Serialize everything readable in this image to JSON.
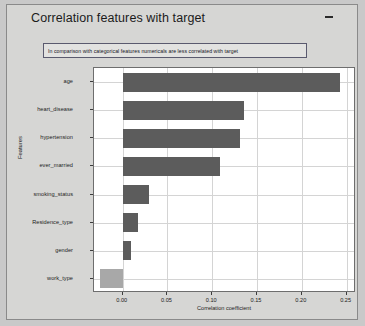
{
  "window": {
    "title": "Correlation features with target",
    "minimize_label": "–"
  },
  "annotation": {
    "text": "In comparison with categorical features numericals are less correlated with target"
  },
  "colors": {
    "bar_dark": "#5c5c5c",
    "bar_light": "#a8a8a8",
    "plot_background": "#ffffff",
    "window_background": "#d6d6d4",
    "grid": "#d4d4d4"
  },
  "chart_data": {
    "type": "bar",
    "orientation": "horizontal",
    "title": "Correlation features with target",
    "xlabel": "Correlation coefficient",
    "ylabel": "Features",
    "categories": [
      "age",
      "heart_disease",
      "hypertension",
      "ever_married",
      "smoking_status",
      "Residence_type",
      "gender",
      "work_type"
    ],
    "values": [
      0.243,
      0.136,
      0.131,
      0.109,
      0.029,
      0.017,
      0.009,
      -0.025
    ],
    "xlim": [
      -0.032,
      0.2605
    ],
    "xticks": [
      0.0,
      0.05,
      0.1,
      0.15,
      0.2,
      0.25
    ],
    "xtick_labels": [
      "0.00",
      "0.05",
      "0.10",
      "0.15",
      "0.20",
      "0.25"
    ],
    "grid": true,
    "legend": "none",
    "annotations": [
      "In comparison with categorical features numericals are less correlated with target"
    ]
  }
}
